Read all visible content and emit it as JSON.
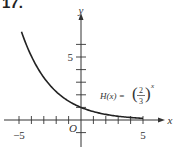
{
  "problem_number": "17.",
  "chart_data": {
    "type": "line",
    "title": "",
    "function_label": "H(x) = (2/3)^x",
    "function_label_parts": {
      "name": "H(x) =",
      "numerator": "2",
      "denominator": "3",
      "exponent": "x"
    },
    "xlabel": "x",
    "ylabel": "y",
    "origin_label": "O",
    "xlim": [
      -5,
      5
    ],
    "ylim": [
      -1,
      7
    ],
    "x_ticks": [
      -5,
      -4,
      -3,
      -2,
      -1,
      1,
      2,
      3,
      4,
      5
    ],
    "x_tick_labels": [
      {
        "value": -5,
        "label": "−5"
      },
      {
        "value": 5,
        "label": "5"
      }
    ],
    "y_ticks": [
      -1,
      1,
      2,
      3,
      4,
      5,
      6
    ],
    "y_tick_labels": [
      {
        "value": 5,
        "label": "5"
      }
    ],
    "series": [
      {
        "name": "H(x) = (2/3)^x",
        "x": [
          -4.8,
          -4,
          -3,
          -2,
          -1,
          0,
          1,
          2,
          3,
          4,
          5
        ],
        "y": [
          7.0,
          5.06,
          3.38,
          2.25,
          1.5,
          1.0,
          0.667,
          0.444,
          0.296,
          0.198,
          0.132
        ]
      }
    ],
    "grid": false,
    "legend": "none"
  },
  "colors": {
    "axis": "#333333",
    "curve": "#222222",
    "text": "#333333"
  }
}
